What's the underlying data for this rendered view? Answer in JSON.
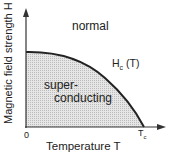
{
  "diagram": {
    "y_axis_label": "Magnetic field strength H",
    "x_axis_label": "Temperature T",
    "origin_label": "0",
    "tc_label": "T",
    "tc_sub": "c",
    "curve_label_main": "H",
    "curve_label_sub": "c",
    "curve_label_arg": "(T)",
    "region_normal": "normal",
    "region_super_line1": "super-",
    "region_super_line2": "conducting"
  },
  "colors": {
    "curve": "#222222",
    "fill": "#d8d8d8",
    "axis": "#333333"
  }
}
